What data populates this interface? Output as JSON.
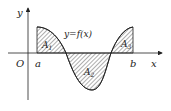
{
  "diagram": {
    "curve_label": "y=f(x)",
    "axis_x_label": "x",
    "axis_y_label": "y",
    "origin_label": "O",
    "lower_bound": "a",
    "upper_bound": "b",
    "regions": [
      {
        "label": "A",
        "sub": "1"
      },
      {
        "label": "A",
        "sub": "2"
      },
      {
        "label": "A",
        "sub": "3"
      }
    ],
    "colors": {
      "stroke": "#222222",
      "hatch": "#333333",
      "background": "#ffffff"
    }
  }
}
